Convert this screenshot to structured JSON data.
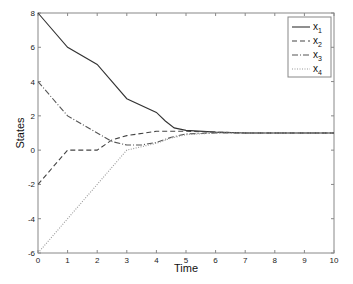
{
  "chart_data": {
    "type": "line",
    "title": "",
    "xlabel": "Time",
    "ylabel": "States",
    "xlim": [
      0,
      10
    ],
    "ylim": [
      -6,
      8
    ],
    "x_ticks": [
      0,
      1,
      2,
      3,
      4,
      5,
      6,
      7,
      8,
      9,
      10
    ],
    "y_ticks": [
      -6,
      -4,
      -2,
      0,
      2,
      4,
      6,
      8
    ],
    "grid": false,
    "legend_position": "upper right",
    "series": [
      {
        "name": "x1",
        "label_base": "x",
        "label_sub": "1",
        "style": "solid",
        "x": [
          0,
          1,
          2,
          3,
          4,
          4.3,
          4.6,
          5,
          6,
          7,
          8,
          9,
          10
        ],
        "y": [
          8,
          6,
          5,
          3,
          2.2,
          1.7,
          1.3,
          1.15,
          1.05,
          1.0,
          1.0,
          1.0,
          1.0
        ]
      },
      {
        "name": "x2",
        "label_base": "x",
        "label_sub": "2",
        "style": "dashed",
        "x": [
          0,
          1,
          2,
          2.5,
          3,
          4,
          5,
          6,
          7,
          8,
          9,
          10
        ],
        "y": [
          -2,
          0,
          0,
          0.6,
          0.85,
          1.1,
          1.1,
          1.05,
          1.0,
          1.0,
          1.0,
          1.0
        ]
      },
      {
        "name": "x3",
        "label_base": "x",
        "label_sub": "3",
        "style": "dashdot",
        "x": [
          0,
          1,
          2,
          2.5,
          3,
          3.5,
          4,
          4.5,
          5,
          6,
          7,
          8,
          9,
          10
        ],
        "y": [
          4,
          2,
          1,
          0.5,
          0.3,
          0.3,
          0.45,
          0.75,
          0.95,
          1.0,
          1.0,
          1.0,
          1.0,
          1.0
        ]
      },
      {
        "name": "x4",
        "label_base": "x",
        "label_sub": "4",
        "style": "dotted",
        "x": [
          0,
          1,
          2,
          3,
          3.5,
          4,
          4.5,
          5,
          6,
          7,
          8,
          9,
          10
        ],
        "y": [
          -6,
          -4,
          -2,
          0,
          0.2,
          0.4,
          0.7,
          0.9,
          1.0,
          1.0,
          1.0,
          1.0,
          1.0
        ]
      }
    ]
  }
}
